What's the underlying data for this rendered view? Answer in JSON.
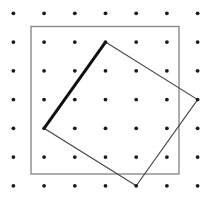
{
  "figure": {
    "canvas": {
      "width": 209,
      "height": 197,
      "background": "#ffffff"
    },
    "dot_grid": {
      "rows": 7,
      "cols": 7,
      "origin_x": 13.4,
      "origin_y": 13.3,
      "spacing_x": 30.7,
      "spacing_y": 28.75,
      "dot_radius": 1.9,
      "dot_color": "#1b1b1b"
    },
    "outer_square": {
      "x": 31,
      "y": 26.5,
      "width": 148,
      "height": 147.5,
      "stroke": "#8a8a8a",
      "stroke_width": 1.4,
      "fill": "none"
    },
    "tilted_square": {
      "grid_vertices": [
        [
          3,
          1
        ],
        [
          6,
          3
        ],
        [
          4,
          6
        ],
        [
          1,
          4
        ]
      ],
      "stroke": "#454545",
      "stroke_width": 1.1,
      "fill": "none"
    },
    "bold_edge": {
      "from_grid": [
        1,
        4
      ],
      "to_grid": [
        3,
        1
      ],
      "stroke": "#101010",
      "stroke_width": 3
    }
  }
}
